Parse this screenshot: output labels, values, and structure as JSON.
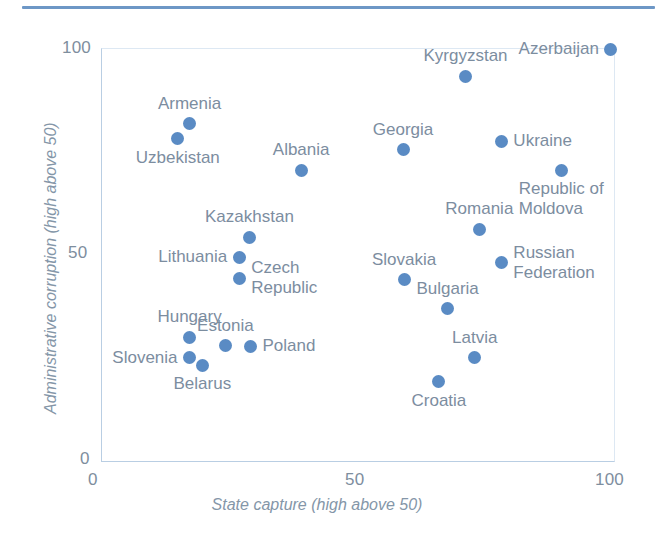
{
  "figure": {
    "top_rule_color": "#6d97c6",
    "point_color": "#5a8bc4",
    "label_color": "#7c8d9f",
    "axis_color": "#b9cee3"
  },
  "axes": {
    "x_title": "State capture (high above 50)",
    "y_title": "Administrative corruption (high above 50)",
    "x_ticks": [
      "0",
      "50",
      "100"
    ],
    "y_ticks": [
      "0",
      "50",
      "100"
    ]
  },
  "chart_data": {
    "type": "scatter",
    "title": "",
    "xlabel": "State capture (high above 50)",
    "ylabel": "Administrative corruption (high above 50)",
    "xlim": [
      0,
      100
    ],
    "ylim": [
      0,
      100
    ],
    "xticks": [
      0,
      50,
      100
    ],
    "yticks": [
      0,
      50,
      100
    ],
    "grid": false,
    "legend": null,
    "points": [
      {
        "label": "Azerbaijan",
        "x": 99.4,
        "y": 100.0,
        "label_pos": "left"
      },
      {
        "label": "Kyrgyzstan",
        "x": 71.0,
        "y": 93.4,
        "label_pos": "above"
      },
      {
        "label": "Armenia",
        "x": 17.1,
        "y": 81.8,
        "label_pos": "above"
      },
      {
        "label": "Uzbekistan",
        "x": 14.8,
        "y": 78.2,
        "label_pos": "below"
      },
      {
        "label": "Ukraine",
        "x": 78.0,
        "y": 77.6,
        "label_pos": "right"
      },
      {
        "label": "Georgia",
        "x": 58.8,
        "y": 75.5,
        "label_pos": "above"
      },
      {
        "label": "Republic of\nMoldova",
        "x": 89.7,
        "y": 70.6,
        "label_pos": "below"
      },
      {
        "label": "Albania",
        "x": 38.9,
        "y": 70.6,
        "label_pos": "above"
      },
      {
        "label": "Romania",
        "x": 73.7,
        "y": 56.2,
        "label_pos": "above"
      },
      {
        "label": "Kazakhstan",
        "x": 28.8,
        "y": 54.3,
        "label_pos": "above"
      },
      {
        "label": "Lithuania",
        "x": 26.8,
        "y": 49.4,
        "label_pos": "left"
      },
      {
        "label": "Russian\nFederation",
        "x": 78.0,
        "y": 48.1,
        "label_pos": "right"
      },
      {
        "label": "Czech\nRepublic",
        "x": 26.8,
        "y": 44.3,
        "label_pos": "right"
      },
      {
        "label": "Slovakia",
        "x": 59.0,
        "y": 44.0,
        "label_pos": "above"
      },
      {
        "label": "Bulgaria",
        "x": 67.5,
        "y": 37.0,
        "label_pos": "above"
      },
      {
        "label": "Hungary",
        "x": 17.1,
        "y": 30.0,
        "label_pos": "above"
      },
      {
        "label": "Estonia",
        "x": 24.1,
        "y": 28.0,
        "label_pos": "above"
      },
      {
        "label": "Poland",
        "x": 29.0,
        "y": 27.8,
        "label_pos": "right"
      },
      {
        "label": "Slovenia",
        "x": 17.1,
        "y": 25.1,
        "label_pos": "left"
      },
      {
        "label": "Latvia",
        "x": 72.8,
        "y": 25.1,
        "label_pos": "above"
      },
      {
        "label": "Belarus",
        "x": 19.6,
        "y": 23.2,
        "label_pos": "below"
      },
      {
        "label": "Croatia",
        "x": 65.8,
        "y": 19.2,
        "label_pos": "below"
      }
    ]
  }
}
